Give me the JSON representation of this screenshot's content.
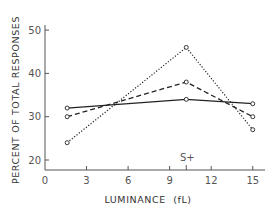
{
  "chart_data": {
    "type": "line",
    "title": "",
    "xlabel": "LUMINANCE  (fL)",
    "ylabel": "PERCENT OF TOTAL RESPONSES",
    "xlim": [
      0,
      16.5
    ],
    "ylim": [
      18,
      52
    ],
    "x_ticks": [
      0,
      3,
      6,
      9,
      12,
      15
    ],
    "x_tick_labels": [
      "0",
      "3",
      "6",
      "9",
      "12",
      "15"
    ],
    "y_ticks": [
      20,
      30,
      40,
      50
    ],
    "y_tick_labels": [
      "20",
      "30",
      "40",
      "50"
    ],
    "grid": false,
    "legend": null,
    "annotations": [
      {
        "text": "S+",
        "x": 10.2,
        "position": "above x-axis tick"
      }
    ],
    "x": [
      1.6,
      10.2,
      15
    ],
    "series": [
      {
        "name": "solid",
        "style": "solid",
        "values": [
          32,
          34,
          33
        ]
      },
      {
        "name": "dashed",
        "style": "dashed",
        "values": [
          30,
          38,
          30
        ]
      },
      {
        "name": "dotted",
        "style": "dotted",
        "values": [
          24,
          46,
          27
        ]
      }
    ]
  },
  "colors": {
    "line": "#222222",
    "axis": "#555555"
  }
}
